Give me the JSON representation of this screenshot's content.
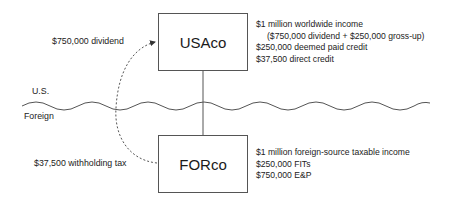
{
  "entities": {
    "us_parent": {
      "name": "USAco"
    },
    "foreign_sub": {
      "name": "FORco"
    }
  },
  "regions": {
    "upper": "U.S.",
    "lower": "Foreign"
  },
  "flows": {
    "dividend": "$750,000 dividend",
    "withholding": "$37,500 withholding tax"
  },
  "usaco_notes": [
    "$1 million worldwide income",
    "($750,000 dividend + $250,000 gross-up)",
    "$250,000 deemed paid credit",
    "$37,500 direct credit"
  ],
  "forco_notes": [
    "$1 million foreign-source taxable income",
    "$250,000 FITs",
    "$750,000 E&P"
  ],
  "colors": {
    "line": "#555555",
    "text": "#1a1a1a",
    "background": "#ffffff"
  }
}
